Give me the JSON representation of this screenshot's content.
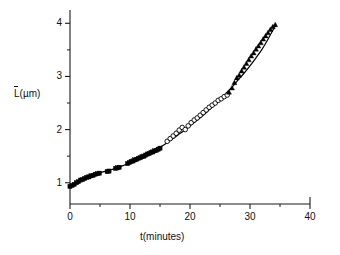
{
  "chart_data": {
    "type": "scatter",
    "title": "",
    "xlabel": "t(minutes)",
    "ylabel": "L(µm)",
    "ylabel_text": "L",
    "ylabel_unit": "(µm)",
    "ylabel_overbar": true,
    "xlim": [
      0,
      40
    ],
    "ylim": [
      0.6,
      4.25
    ],
    "xticks": [
      0,
      10,
      20,
      30,
      40
    ],
    "xticklabels": [
      "0",
      "10",
      "20",
      "30",
      "40"
    ],
    "xminorticks": [
      5,
      15,
      25,
      35
    ],
    "yticks": [
      1,
      2,
      3,
      4
    ],
    "yticklabels": [
      "1",
      "2",
      "3",
      "4"
    ],
    "yminorticks": [
      1.5,
      2.5,
      3.5
    ],
    "grid": false,
    "legend": "none",
    "frame": "left-bottom",
    "colors": {
      "axis": "#1a1a1a",
      "marker_filled": "#000000",
      "marker_open_edge": "#000000",
      "marker_open_fill": "#ffffff",
      "curve": "#000000"
    },
    "series": [
      {
        "name": "filled-squares",
        "marker": "square-filled",
        "marker_size": 4.2,
        "x": [
          0.0,
          0.35,
          0.7,
          1.05,
          1.4,
          1.75,
          2.1,
          2.45,
          2.8,
          3.15,
          3.5,
          3.85,
          4.2,
          4.55,
          4.9,
          6.2,
          6.5,
          7.6,
          7.9,
          8.2,
          9.6,
          9.9,
          10.2,
          10.5,
          10.8,
          11.1,
          11.4,
          11.7,
          12.0,
          12.3,
          12.6,
          12.9,
          13.2,
          13.5,
          13.8,
          14.1,
          14.4,
          14.7,
          15.0
        ],
        "y": [
          0.93,
          0.95,
          0.97,
          1.0,
          1.02,
          1.05,
          1.06,
          1.08,
          1.1,
          1.11,
          1.13,
          1.14,
          1.16,
          1.17,
          1.18,
          1.21,
          1.22,
          1.27,
          1.28,
          1.29,
          1.36,
          1.38,
          1.4,
          1.41,
          1.43,
          1.44,
          1.46,
          1.47,
          1.49,
          1.5,
          1.52,
          1.54,
          1.55,
          1.57,
          1.58,
          1.6,
          1.61,
          1.63,
          1.65
        ]
      },
      {
        "name": "open-circles",
        "marker": "circle-open",
        "marker_size": 4.6,
        "x": [
          16.2,
          16.7,
          17.2,
          17.7,
          18.2,
          18.7,
          19.2,
          19.7,
          20.2,
          20.7,
          21.2,
          21.7,
          22.2,
          22.7,
          23.2,
          23.7,
          24.2,
          24.7,
          25.2,
          25.7,
          26.2
        ],
        "y": [
          1.78,
          1.83,
          1.88,
          1.93,
          1.99,
          2.04,
          2.0,
          2.07,
          2.13,
          2.18,
          2.22,
          2.27,
          2.32,
          2.37,
          2.42,
          2.46,
          2.5,
          2.55,
          2.58,
          2.62,
          2.65
        ]
      },
      {
        "name": "filled-triangles",
        "marker": "triangle-filled",
        "marker_size": 5.0,
        "x": [
          26.5,
          27.0,
          27.4,
          27.8,
          28.2,
          28.6,
          29.0,
          29.4,
          29.8,
          30.2,
          30.6,
          31.0,
          31.4,
          31.8,
          32.2,
          32.6,
          33.0,
          33.4,
          33.8,
          34.2
        ],
        "y": [
          2.7,
          2.78,
          2.88,
          2.97,
          3.02,
          3.1,
          3.17,
          3.24,
          3.31,
          3.38,
          3.44,
          3.51,
          3.57,
          3.63,
          3.7,
          3.76,
          3.82,
          3.88,
          3.93,
          3.97
        ]
      }
    ],
    "fit_curve": {
      "name": "fit-line",
      "x": [
        0.0,
        1.0,
        2.0,
        3.0,
        4.0,
        5.0,
        6.0,
        7.0,
        8.0,
        9.0,
        10.0,
        11.0,
        12.0,
        13.0,
        14.0,
        15.0,
        16.0,
        17.0,
        18.0,
        19.0,
        20.0,
        21.0,
        22.0,
        23.0,
        24.0,
        25.0,
        26.0,
        27.0,
        28.0,
        29.0,
        30.0,
        31.0,
        32.0,
        33.0,
        34.3
      ],
      "y": [
        0.93,
        1.0,
        1.06,
        1.11,
        1.16,
        1.19,
        1.22,
        1.25,
        1.29,
        1.33,
        1.38,
        1.44,
        1.5,
        1.55,
        1.61,
        1.67,
        1.74,
        1.82,
        1.9,
        1.98,
        2.07,
        2.16,
        2.25,
        2.35,
        2.45,
        2.56,
        2.68,
        2.8,
        2.93,
        3.06,
        3.2,
        3.35,
        3.51,
        3.7,
        3.97
      ]
    }
  },
  "axes_geometry": {
    "plot_left_px": 70,
    "plot_right_px": 310,
    "plot_top_px": 10,
    "plot_bottom_px": 204
  }
}
